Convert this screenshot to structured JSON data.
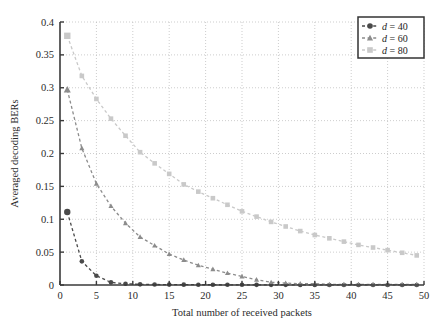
{
  "figure": {
    "background": "#ffffff",
    "plot_area": {
      "left": 60,
      "top": 22,
      "right": 424,
      "bottom": 285
    },
    "axis_color": "#3a3a3a",
    "grid_color": "#b8b8b8"
  },
  "chart_data": {
    "type": "line",
    "title": "",
    "xlabel": "Total number of received packets",
    "ylabel": "Averaged decoding BERs",
    "xlim": [
      0,
      50
    ],
    "ylim": [
      0,
      0.4
    ],
    "xticks": [
      0,
      5,
      10,
      15,
      20,
      25,
      30,
      35,
      40,
      45,
      50
    ],
    "xticklabels": [
      "0",
      "5",
      "10",
      "15",
      "20",
      "25",
      "30",
      "35",
      "40",
      "45",
      "50"
    ],
    "yticks": [
      0,
      0.05,
      0.1,
      0.15,
      0.2,
      0.25,
      0.3,
      0.35,
      0.4
    ],
    "yticklabels": [
      "0",
      "0.05",
      "0.1",
      "0.15",
      "0.2",
      "0.25",
      "0.3",
      "0.35",
      "0.4"
    ],
    "grid": true,
    "grid_style": "dotted",
    "legend_position": "upper right",
    "x": [
      1,
      3,
      5,
      7,
      9,
      11,
      13,
      15,
      17,
      19,
      21,
      23,
      25,
      27,
      29,
      31,
      33,
      35,
      37,
      39,
      41,
      43,
      45,
      47,
      49
    ],
    "series": [
      {
        "name": "d = 40",
        "label_italic": "d",
        "label_rest": " = 40",
        "marker": "circle",
        "color": "#4a4a4a",
        "linestyle": "dashed",
        "values": [
          0.111,
          0.036,
          0.014,
          0.004,
          0.002,
          0.001,
          0.0008,
          0.0006,
          0.0005,
          0.0004,
          0.0004,
          0.0003,
          0.0003,
          0.0002,
          0.0002,
          0.0002,
          0.0001,
          0.0001,
          0.0001,
          0.0001,
          0.0001,
          0.0001,
          0.0001,
          0.0001,
          0.0001
        ]
      },
      {
        "name": "d = 60",
        "label_italic": "d",
        "label_rest": " = 60",
        "marker": "triangle",
        "color": "#8c8c8c",
        "linestyle": "dashed",
        "values": [
          0.297,
          0.208,
          0.154,
          0.12,
          0.094,
          0.073,
          0.06,
          0.047,
          0.038,
          0.03,
          0.024,
          0.018,
          0.013,
          0.008,
          0.004,
          0.003,
          0.002,
          0.002,
          0.001,
          0.001,
          0.001,
          0.001,
          0.001,
          0.001,
          0.001
        ]
      },
      {
        "name": "d = 80",
        "label_italic": "d",
        "label_rest": " = 80",
        "marker": "square",
        "color": "#c9c9c9",
        "linestyle": "dashed",
        "values": [
          0.379,
          0.318,
          0.283,
          0.253,
          0.227,
          0.202,
          0.185,
          0.169,
          0.153,
          0.142,
          0.132,
          0.122,
          0.112,
          0.104,
          0.096,
          0.089,
          0.082,
          0.076,
          0.071,
          0.066,
          0.061,
          0.057,
          0.053,
          0.049,
          0.045
        ]
      }
    ]
  },
  "legend": {
    "items": [
      {
        "text": "d = 40",
        "marker": "circle",
        "color": "#4a4a4a"
      },
      {
        "text": "d = 60",
        "marker": "triangle",
        "color": "#8c8c8c"
      },
      {
        "text": "d = 80",
        "marker": "square",
        "color": "#c9c9c9"
      }
    ]
  }
}
